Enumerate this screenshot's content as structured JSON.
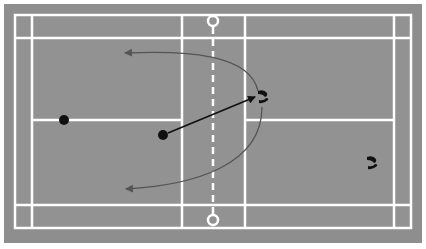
{
  "diagram": {
    "court": {
      "surround_color": "#8e8e8e",
      "surface_color": "#929292",
      "line_color": "#ffffff",
      "net_style": "dashed",
      "net_posts": [
        "top",
        "bottom"
      ]
    },
    "players": [
      {
        "id": "player-1",
        "side": "left",
        "x": 64,
        "y": 120,
        "color": "#111111"
      },
      {
        "id": "player-2",
        "side": "left",
        "x": 163,
        "y": 135,
        "color": "#111111"
      }
    ],
    "footprints": [
      {
        "id": "footprints-1",
        "side": "right",
        "x": 262,
        "y": 97
      },
      {
        "id": "footprints-2",
        "side": "right",
        "x": 371,
        "y": 163
      }
    ],
    "arrows": [
      {
        "id": "shot-arrow",
        "type": "straight",
        "color": "#111111",
        "from": [
          168,
          133
        ],
        "to": [
          255,
          97
        ]
      },
      {
        "id": "move-arrow-top",
        "type": "curved",
        "color": "#555555",
        "from": [
          258,
          91
        ],
        "to": [
          125,
          53
        ]
      },
      {
        "id": "move-arrow-bottom",
        "type": "curved",
        "color": "#555555",
        "from": [
          262,
          107
        ],
        "to": [
          126,
          189
        ]
      }
    ]
  }
}
